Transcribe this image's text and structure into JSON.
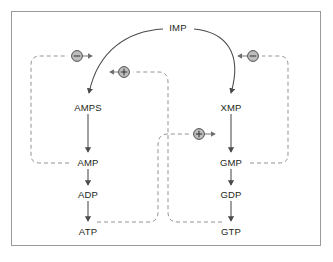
{
  "figure": {
    "background_color": "#ffffff",
    "frame_color": "#9a9a9a",
    "solid_line_color": "#4a4a4a",
    "dashed_line_color": "#8d8d8d",
    "node_text_color": "#231f20",
    "badge_fill": "#bdbdbd",
    "badge_stroke": "#4f4f4f"
  },
  "nodes": [
    {
      "id": "IMP",
      "label": "IMP",
      "x": 178,
      "y": 28
    },
    {
      "id": "AMPS",
      "label": "AMPS",
      "x": 88,
      "y": 108
    },
    {
      "id": "XMP",
      "label": "XMP",
      "x": 231,
      "y": 108
    },
    {
      "id": "AMP",
      "label": "AMP",
      "x": 88,
      "y": 163
    },
    {
      "id": "GMP",
      "label": "GMP",
      "x": 231,
      "y": 163
    },
    {
      "id": "ADP",
      "label": "ADP",
      "x": 88,
      "y": 195
    },
    {
      "id": "GDP",
      "label": "GDP",
      "x": 231,
      "y": 195
    },
    {
      "id": "ATP",
      "label": "ATP",
      "x": 88,
      "y": 232
    },
    {
      "id": "GTP",
      "label": "GTP",
      "x": 231,
      "y": 232
    }
  ],
  "badges": [
    {
      "id": "inhibit-amps",
      "sign": "−",
      "x": 77,
      "y": 56,
      "type": "inhibition"
    },
    {
      "id": "activate-amps",
      "sign": "+",
      "x": 124,
      "y": 72,
      "type": "activation"
    },
    {
      "id": "inhibit-xmp",
      "sign": "−",
      "x": 253,
      "y": 56,
      "type": "inhibition"
    },
    {
      "id": "activate-xmp",
      "sign": "+",
      "x": 199,
      "y": 134,
      "type": "activation"
    }
  ],
  "reactions": [
    {
      "from": "IMP",
      "to": "AMPS",
      "kind": "solid-curved"
    },
    {
      "from": "IMP",
      "to": "XMP",
      "kind": "solid-curved"
    },
    {
      "from": "AMPS",
      "to": "AMP",
      "kind": "solid-straight"
    },
    {
      "from": "AMP",
      "to": "ADP",
      "kind": "solid-straight"
    },
    {
      "from": "ADP",
      "to": "ATP",
      "kind": "solid-straight"
    },
    {
      "from": "XMP",
      "to": "GMP",
      "kind": "solid-straight"
    },
    {
      "from": "GMP",
      "to": "GDP",
      "kind": "solid-straight"
    },
    {
      "from": "GDP",
      "to": "GTP",
      "kind": "solid-straight"
    }
  ],
  "regulations": [
    {
      "from": "AMP",
      "to": "IMP-to-AMPS",
      "effect": "inhibition",
      "badge": "inhibit-amps",
      "kind": "dashed"
    },
    {
      "from": "GMP",
      "to": "IMP-to-XMP",
      "effect": "inhibition",
      "badge": "inhibit-xmp",
      "kind": "dashed"
    },
    {
      "from": "GTP",
      "to": "IMP-to-AMPS",
      "effect": "activation",
      "badge": "activate-amps",
      "kind": "dashed"
    },
    {
      "from": "ATP",
      "to": "IMP-to-XMP",
      "effect": "activation",
      "badge": "activate-xmp",
      "kind": "dashed"
    }
  ]
}
